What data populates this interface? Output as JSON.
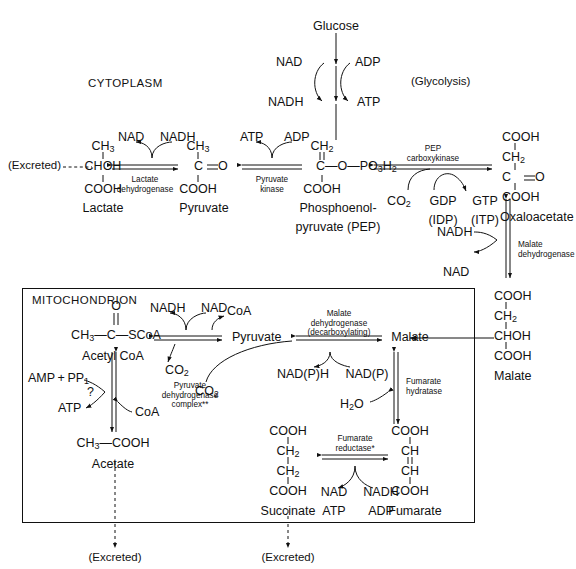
{
  "diagram": {
    "compartments": {
      "cytoplasm": "CYTOPLASM",
      "mitochondrion": "MITOCHONDRION"
    }
  },
  "glycolysis": {
    "substrate": "Glucose",
    "pathway_label": "(Glycolysis)",
    "cofactor_in_left": "NAD",
    "cofactor_out_left": "NADH",
    "cofactor_in_right": "ADP",
    "cofactor_out_right": "ATP"
  },
  "lactate": {
    "name": "Lactate",
    "excreted_label": "(Excreted)",
    "structure": [
      "CH3",
      "CHOH",
      "COOH"
    ],
    "enzyme_line1": "Lactate",
    "enzyme_line2": "dehydrogenase",
    "cofactor_left": "NAD",
    "cofactor_right": "NADH"
  },
  "pyruvate_cyto": {
    "name": "Pyruvate",
    "structure": [
      "CH3",
      "C=O",
      "COOH"
    ]
  },
  "pyruvate_kinase": {
    "enzyme_line1": "Pyruvate",
    "enzyme_line2": "kinase",
    "cofactor_left": "ATP",
    "cofactor_right": "ADP"
  },
  "pep": {
    "name_line1": "Phosphoenol-",
    "name_line2": "pyruvate (PEP)",
    "structure_top": "CH2",
    "structure_mid": "C—O—PO3H2",
    "structure_bottom": "COOH"
  },
  "pep_carboxykinase": {
    "enzyme_line1": "PEP",
    "enzyme_line2": "carboxykinase",
    "substrate_co2": "CO2",
    "nucleotide_in": "GDP",
    "nucleotide_in_alt": "(IDP)",
    "nucleotide_out": "GTP",
    "nucleotide_out_alt": "(ITP)"
  },
  "oxaloacetate": {
    "name": "Oxaloacetate",
    "structure": [
      "COOH",
      "CH2",
      "C=O",
      "COOH"
    ]
  },
  "malate_dehydrogenase_cyto": {
    "enzyme_line1": "Malate",
    "enzyme_line2": "dehydrogenase",
    "cofactor_in": "NADH",
    "cofactor_out": "NAD"
  },
  "malate_cyto": {
    "name": "Malate",
    "structure": [
      "COOH",
      "CH2",
      "CHOH",
      "COOH"
    ]
  },
  "acetyl_coa": {
    "name": "Acetyl  CoA",
    "structure_o": "O",
    "structure_main": "CH3—C—SCoA"
  },
  "acetate": {
    "name": "Acetate",
    "structure": "CH3—COOH",
    "excreted_label": "(Excreted)",
    "cofactor_left_in": "AMP + PP1",
    "cofactor_left_out": "ATP",
    "unknown_enzyme": "?",
    "cofactor_right": "CoA"
  },
  "pdh_complex": {
    "enzyme_line1": "Pyruvate",
    "enzyme_line2": "dehydrogenase",
    "enzyme_line3": "complex**",
    "cofactor_in": "NADH",
    "cofactor_out": "NAD",
    "cofactor_coa": "CoA",
    "product_co2": "CO2"
  },
  "pyruvate_mito": {
    "name": "Pyruvate",
    "product_co2": "CO2"
  },
  "malic_enzyme": {
    "enzyme_line1": "Malate",
    "enzyme_line2": "dehydrogenase",
    "enzyme_line3": "(decarboxylating)",
    "cofactor_left": "NAD(P)H",
    "cofactor_right": "NAD(P)"
  },
  "malate_mito": {
    "name": "Malate"
  },
  "fumarate_hydratase": {
    "enzyme_line1": "Fumarate",
    "enzyme_line2": "hydratase",
    "cofactor_water": "H2O"
  },
  "fumarate": {
    "name": "Fumarate",
    "structure": [
      "COOH",
      "CH",
      "CH",
      "COOH"
    ]
  },
  "fumarate_reductase": {
    "enzyme_line1": "Fumarate",
    "enzyme_line2": "reductase*",
    "cofactor_in_1": "NAD",
    "cofactor_in_2": "ATP",
    "cofactor_out_1": "NADH",
    "cofactor_out_2": "ADP"
  },
  "succinate": {
    "name": "Succinate",
    "structure": [
      "COOH",
      "CH2",
      "CH2",
      "COOH"
    ],
    "excreted_label": "(Excreted)"
  },
  "colors": {
    "ink": "#111111",
    "background": "#ffffff"
  }
}
